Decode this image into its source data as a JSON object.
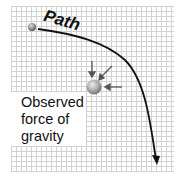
{
  "diagram": {
    "path_label": "Path",
    "observed_label": "Observed\nforce of\ngravity",
    "elements": {
      "start_body": "small grey sphere at start of path",
      "central_mass": "grey sphere with converging force arrows",
      "trajectory": "curved path bending downward, ending in arrowhead"
    },
    "colors": {
      "grid": "#d2d2d2",
      "path": "#111111",
      "sphere": "#a8a8a8",
      "force_arrow": "#555555"
    }
  }
}
